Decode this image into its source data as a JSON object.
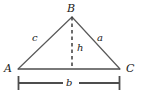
{
  "figure": {
    "kind": "geometry-triangle-diagram",
    "colors": {
      "stroke": "#595959",
      "base_stroke": "#4d4d4d",
      "dimension_stroke": "#4d4d4d",
      "label": "#1a1a1a",
      "background": "#ffffff"
    },
    "vertices": [
      {
        "id": "B",
        "label": "B",
        "x": 72,
        "y": 17
      },
      {
        "id": "A",
        "label": "A",
        "x": 18,
        "y": 69
      },
      {
        "id": "C",
        "label": "C",
        "x": 120,
        "y": 69
      }
    ],
    "sides": [
      {
        "id": "c",
        "label": "c",
        "from": "A",
        "to": "B"
      },
      {
        "id": "a",
        "label": "a",
        "from": "B",
        "to": "C"
      },
      {
        "id": "b",
        "label": "b",
        "from": "A",
        "to": "C"
      }
    ],
    "altitude": {
      "id": "h",
      "label": "h",
      "style": "dashed",
      "from_x": 72,
      "from_y": 17,
      "to_x": 72,
      "to_y": 69
    },
    "dimension_line": {
      "label": "b",
      "y": 83,
      "x_start": 18,
      "x_end": 120,
      "cap_style": "vertical-tick",
      "cap_half_height": 7
    }
  }
}
